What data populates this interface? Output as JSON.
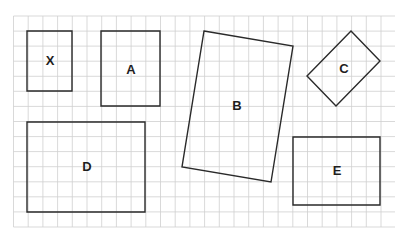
{
  "diagram": {
    "type": "shapes-on-grid",
    "background": "#ffffff",
    "grid": {
      "left": 13.5,
      "top": 16,
      "right": 395,
      "bottom": 227,
      "col_spacing": 14.7,
      "row_spacing": 15.07,
      "color": "#cfcfcf"
    },
    "stroke_color": "#2a2a2a",
    "shapes": [
      {
        "id": "X",
        "label": "X",
        "kind": "rect",
        "points": [
          [
            27,
            31
          ],
          [
            72,
            31
          ],
          [
            72,
            91
          ],
          [
            27,
            91
          ]
        ],
        "label_pos": [
          50,
          62
        ]
      },
      {
        "id": "A",
        "label": "A",
        "kind": "rect",
        "points": [
          [
            101,
            31
          ],
          [
            160,
            31
          ],
          [
            160,
            106
          ],
          [
            101,
            106
          ]
        ],
        "label_pos": [
          131,
          71
        ]
      },
      {
        "id": "B",
        "label": "B",
        "kind": "rotated-rect",
        "points": [
          [
            204,
            31
          ],
          [
            293,
            46
          ],
          [
            271,
            182
          ],
          [
            182,
            167
          ]
        ],
        "label_pos": [
          237,
          107
        ]
      },
      {
        "id": "C",
        "label": "C",
        "kind": "rotated-rect",
        "points": [
          [
            351,
            31
          ],
          [
            380,
            61
          ],
          [
            336,
            106
          ],
          [
            307,
            76
          ]
        ],
        "label_pos": [
          344,
          70
        ]
      },
      {
        "id": "D",
        "label": "D",
        "kind": "rect",
        "points": [
          [
            27,
            122
          ],
          [
            145,
            122
          ],
          [
            145,
            212
          ],
          [
            27,
            212
          ]
        ],
        "label_pos": [
          87,
          168
        ]
      },
      {
        "id": "E",
        "label": "E",
        "kind": "rect",
        "points": [
          [
            293,
            137
          ],
          [
            380,
            137
          ],
          [
            380,
            205
          ],
          [
            293,
            205
          ]
        ],
        "label_pos": [
          337,
          172
        ]
      }
    ]
  }
}
